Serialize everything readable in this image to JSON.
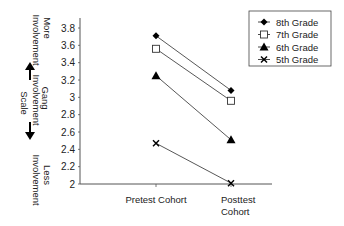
{
  "chart_data": {
    "type": "line",
    "title": "",
    "xlabel": "",
    "ylabel": "Gang Involvement Scale",
    "ylabel_top": "More Involvement",
    "ylabel_bottom": "Less Involvement",
    "categories": [
      "Pretest Cohort",
      "Posttest Cohort"
    ],
    "category_lines": [
      [
        "Pretest Cohort"
      ],
      [
        "Posttest",
        "Cohort"
      ]
    ],
    "ylim": [
      2,
      3.8
    ],
    "yticks": [
      2,
      2.2,
      2.4,
      2.6,
      2.8,
      3,
      3.2,
      3.4,
      3.6,
      3.8
    ],
    "ytick_labels": [
      "2",
      "2.2",
      "2.4",
      "2.6",
      "2.8",
      "3",
      "3.2",
      "3.4",
      "3.6",
      "3.8"
    ],
    "grid": false,
    "legend_position": "top-right",
    "series": [
      {
        "name": "8th Grade",
        "marker": "diamond",
        "values": [
          3.71,
          3.08
        ]
      },
      {
        "name": "7th Grade",
        "marker": "open-square",
        "values": [
          3.56,
          2.96
        ]
      },
      {
        "name": "6th Grade",
        "marker": "triangle",
        "values": [
          3.25,
          2.51
        ]
      },
      {
        "name": "5th Grade",
        "marker": "x",
        "values": [
          2.47,
          2.01
        ]
      }
    ]
  }
}
